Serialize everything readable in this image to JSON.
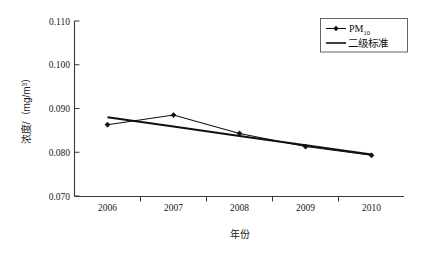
{
  "chart_data": {
    "type": "line",
    "title": "",
    "xlabel": "年份",
    "ylabel": "浓度/（mg/m³）",
    "ylabel_parts": {
      "main": "浓度/（mg/m",
      "superscript": "3",
      "tail": "）"
    },
    "categories": [
      "2006",
      "2007",
      "2008",
      "2009",
      "2010"
    ],
    "x": [
      2006,
      2007,
      2008,
      2009,
      2010
    ],
    "xlim": [
      2005.6,
      2010.4
    ],
    "ylim": [
      0.07,
      0.11
    ],
    "ytick_labels": [
      "0.070",
      "0.080",
      "0.090",
      "0.100",
      "0.110"
    ],
    "ytick_values": [
      0.07,
      0.08,
      0.09,
      0.1,
      0.11
    ],
    "xtick_labels": [
      "2006",
      "2007",
      "2008",
      "2009",
      "2010"
    ],
    "grid": false,
    "legend_position": "top-right",
    "series": [
      {
        "name": "PM10",
        "name_base": "PM",
        "name_sub": "10",
        "marker": "diamond",
        "style": "line-with-markers",
        "color": "#101010",
        "values": [
          0.0863,
          0.0885,
          0.0843,
          0.0813,
          0.0793
        ]
      },
      {
        "name": "二级标准",
        "marker": "none",
        "style": "thick-line",
        "color": "#101010",
        "values": [
          0.088,
          0.0859,
          0.0837,
          0.0816,
          0.0795
        ]
      }
    ],
    "annotations": []
  },
  "legend": {
    "entries": [
      {
        "label_base": "PM",
        "label_sub": "10",
        "icon": "line-with-diamond-marker"
      },
      {
        "label": "二级标准",
        "icon": "plain-line"
      }
    ]
  },
  "axes": {
    "y_title": "浓度/（mg/m³）",
    "x_title": "年份"
  }
}
